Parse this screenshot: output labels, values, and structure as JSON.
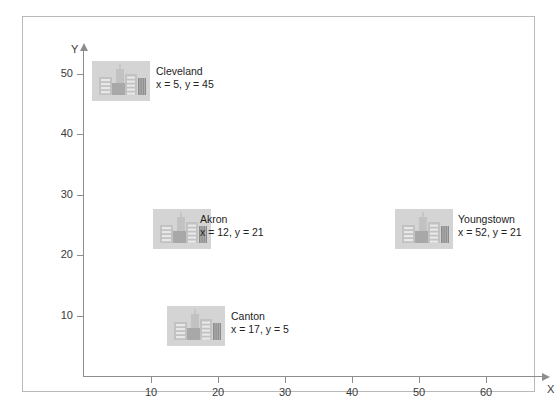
{
  "figure": {
    "axes": {
      "x": {
        "name": "X",
        "ticks": [
          10,
          20,
          30,
          40,
          50,
          60
        ],
        "range": [
          0,
          68
        ]
      },
      "y": {
        "name": "Y",
        "ticks": [
          10,
          20,
          30,
          40,
          50
        ],
        "range": [
          0,
          54
        ]
      }
    }
  },
  "chart_data": {
    "type": "scatter",
    "title": "",
    "xlabel": "X",
    "ylabel": "Y",
    "xlim": [
      0,
      68
    ],
    "ylim": [
      0,
      54
    ],
    "xticks": [
      10,
      20,
      30,
      40,
      50,
      60
    ],
    "yticks": [
      10,
      20,
      30,
      40,
      50
    ],
    "grid": false,
    "legend": "none",
    "marker": "city-skyline-icon",
    "points": [
      {
        "label": "Cleveland",
        "x": 5,
        "y": 45,
        "coords_text": "x = 5, y = 45"
      },
      {
        "label": "Akron",
        "x": 12,
        "y": 21,
        "coords_text": "x = 12, y = 21"
      },
      {
        "label": "Canton",
        "x": 17,
        "y": 5,
        "coords_text": "x = 17, y = 5"
      },
      {
        "label": "Youngstown",
        "x": 52,
        "y": 21,
        "coords_text": "x = 52, y = 21"
      }
    ]
  },
  "cities": [
    {
      "name": "Cleveland",
      "coords_text": "x = 5, y = 45",
      "icon_left": 69,
      "icon_top": 44,
      "label_left": 133,
      "label_top": 48
    },
    {
      "name": "Akron",
      "coords_text": "x = 12, y = 21",
      "icon_left": 130,
      "icon_top": 192,
      "label_left": 177,
      "label_top": 196
    },
    {
      "name": "Canton",
      "coords_text": "x = 17, y = 5",
      "icon_left": 144,
      "icon_top": 289,
      "label_left": 208,
      "label_top": 293
    },
    {
      "name": "Youngstown",
      "coords_text": "x = 52, y = 21",
      "icon_left": 372,
      "icon_top": 192,
      "label_left": 435,
      "label_top": 196
    }
  ],
  "colors": {
    "frame_border": "#b9b9b9",
    "axis": "#8d8d8d",
    "tick_text": "#3a3a3a",
    "label_text": "#232323",
    "icon_background": "#d4d4d4",
    "building_mid": "#a8a8a8",
    "building_light": "#c2c2c2",
    "building_dark": "#8a8a8a",
    "window": "#e8e8e8"
  }
}
